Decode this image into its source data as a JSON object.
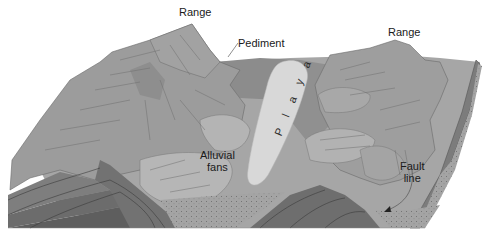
{
  "diagram": {
    "labels": {
      "range_left": "Range",
      "range_right": "Range",
      "pediment": "Pediment",
      "playa": "P l a y a",
      "alluvial_fans_line1": "Alluvial",
      "alluvial_fans_line2": "fans",
      "fault_line_line1": "Fault",
      "fault_line_line2": "line"
    },
    "colors": {
      "background": "#ffffff",
      "mountain": "#9a9a9a",
      "mountain_dark": "#8a8a8a",
      "basin_floor": "#a8a8a8",
      "pediment": "#8e8e8e",
      "playa": "#d6d6d6",
      "fans": "#b8b8b8",
      "strata_1": "#7a7a7a",
      "strata_2": "#6a6a6a",
      "strata_3": "#5c5c5c",
      "sediment": "#a2a2a2",
      "line": "#5a5a5a"
    }
  }
}
